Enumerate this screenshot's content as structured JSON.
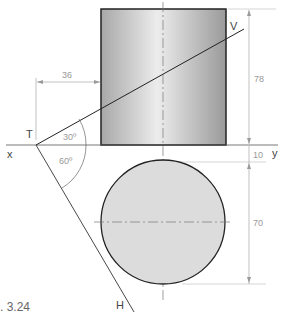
{
  "figure": {
    "caption": ". 3.24",
    "labels": {
      "x": "x",
      "y": "y",
      "T": "T",
      "V": "V",
      "H": "H"
    },
    "dimensions": {
      "offset_horizontal": "36",
      "height_elevation": "78",
      "gap": "10",
      "diameter_plan": "70"
    },
    "angles": {
      "vertical_trace": "30º",
      "horizontal_trace": "60º"
    },
    "colors": {
      "outline": "#222222",
      "dimension_line": "#999999",
      "plan_fill": "#d9d9d9",
      "elevation_dark": "#a8a8a8",
      "elevation_light": "#ececec"
    }
  }
}
